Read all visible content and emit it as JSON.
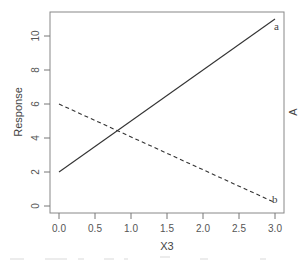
{
  "chart_data": {
    "type": "line",
    "title": "",
    "xlabel": "X3",
    "ylabel": "Response",
    "right_label": "A",
    "xlim": [
      0,
      3
    ],
    "ylim": [
      0,
      11
    ],
    "x_ticks": [
      "0.0",
      "0.5",
      "1.0",
      "1.5",
      "2.0",
      "2.5",
      "3.0"
    ],
    "y_ticks": [
      "0",
      "2",
      "4",
      "6",
      "8",
      "10"
    ],
    "grid": false,
    "legend": "none (lines labeled directly at right end)",
    "series": [
      {
        "name": "a",
        "style": "solid",
        "x": [
          0,
          3
        ],
        "values": [
          2,
          11
        ]
      },
      {
        "name": "b",
        "style": "dashed",
        "x": [
          0,
          3
        ],
        "values": [
          6,
          0.2
        ]
      }
    ]
  },
  "labels": {
    "x_axis_title": "X3",
    "y_axis_title": "Response",
    "right_axis_title": "A",
    "series_a": "a",
    "series_b": "b",
    "x_ticks": [
      "0.0",
      "0.5",
      "1.0",
      "1.5",
      "2.0",
      "2.5",
      "3.0"
    ],
    "y_ticks": [
      "0",
      "2",
      "4",
      "6",
      "8",
      "10"
    ]
  },
  "colors": {
    "axis": "#777777",
    "line": "#333333",
    "text": "#555555"
  }
}
